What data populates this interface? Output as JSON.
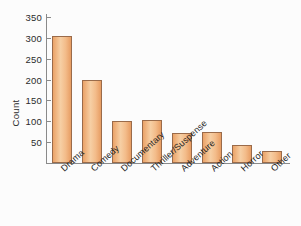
{
  "chart_data": {
    "type": "bar",
    "title": "",
    "xlabel": "",
    "ylabel": "Count",
    "categories": [
      "Drama",
      "Comedy",
      "Documentary",
      "Thriller/Suspense",
      "Adventure",
      "Action",
      "Horror",
      "Other"
    ],
    "values": [
      305,
      199,
      101,
      102,
      73,
      74,
      43,
      28
    ],
    "ylim": [
      0,
      350
    ],
    "yticks": [
      50,
      100,
      150,
      200,
      250,
      300,
      350
    ],
    "grid": false,
    "legend": null,
    "colors": {
      "bar_fill": "#f3bc8a",
      "bar_border": "#9a6b4a",
      "axis": "#8a8a8a",
      "text": "#1f1f1f",
      "background": "#fcfcfc"
    }
  }
}
